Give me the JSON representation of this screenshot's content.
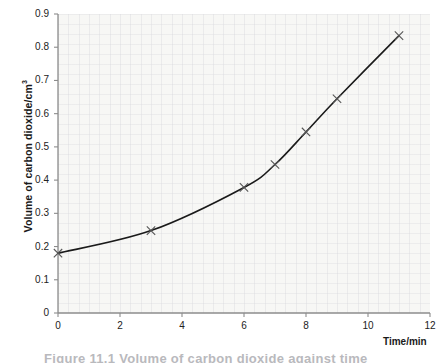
{
  "figure": {
    "background_color": "#ffffff",
    "plot_background_color": "#f7f7f5",
    "axis_color": "#8c8c8c",
    "curve_color": "#1a1a1a",
    "marker_color": "#555555",
    "caption_partial": "Figure 11.1  Volume of carbon dioxide against time"
  },
  "chart_data": {
    "type": "line",
    "title": "",
    "xlabel": "Time/min",
    "ylabel": "Volume of carbon dioxide/cm³",
    "xlim": [
      0,
      12
    ],
    "ylim": [
      0,
      0.9
    ],
    "grid": true,
    "legend": false,
    "xticks": [
      "0",
      "2",
      "4",
      "6",
      "8",
      "10",
      "12"
    ],
    "xtick_values": [
      0,
      2,
      4,
      6,
      8,
      10,
      12
    ],
    "yticks": [
      "0",
      "0.1",
      "0.2",
      "0.3",
      "0.4",
      "0.5",
      "0.6",
      "0.7",
      "0.8",
      "0.9"
    ],
    "ytick_values": [
      0,
      0.1,
      0.2,
      0.3,
      0.4,
      0.5,
      0.6,
      0.7,
      0.8,
      0.9
    ],
    "series": [
      {
        "name": "Volume of carbon dioxide",
        "marker": "x",
        "x": [
          0,
          3,
          6,
          7,
          8,
          9,
          11
        ],
        "y": [
          0.18,
          0.248,
          0.378,
          0.447,
          0.545,
          0.645,
          0.835
        ]
      }
    ]
  }
}
